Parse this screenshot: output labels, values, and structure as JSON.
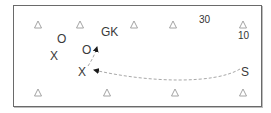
{
  "diagram": {
    "title": "",
    "colors": {
      "border": "#6a6a6a",
      "cone": "#9a9a9a",
      "text": "#333333",
      "arrow": "#a8a8a8"
    },
    "cones": [
      {
        "x": 38,
        "y": 24
      },
      {
        "x": 80,
        "y": 24
      },
      {
        "x": 134,
        "y": 24
      },
      {
        "x": 173,
        "y": 24
      },
      {
        "x": 243,
        "y": 24
      },
      {
        "x": 38,
        "y": 92
      },
      {
        "x": 107,
        "y": 92
      },
      {
        "x": 175,
        "y": 92
      },
      {
        "x": 243,
        "y": 92
      }
    ],
    "labels": {
      "gk": "GK",
      "attacker_top": "O",
      "attacker_mid": "O",
      "defender_left": "X",
      "defender_mid": "X",
      "server": "S",
      "dim_width": "30",
      "dim_height": "10"
    },
    "movements": [
      {
        "from": "S",
        "to": "X (mid)",
        "style": "dashed-curve"
      },
      {
        "from": "X (mid)",
        "to": "O (mid)",
        "style": "dashed"
      }
    ]
  }
}
